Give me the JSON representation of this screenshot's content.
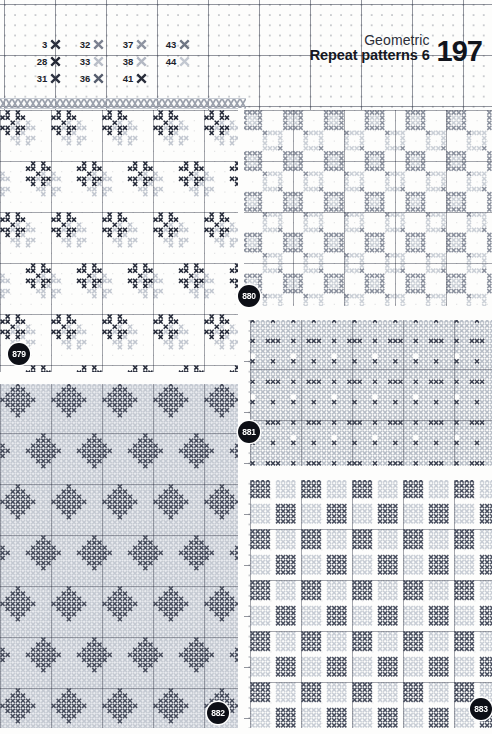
{
  "header": {
    "category": "Geometric",
    "title": "Repeat patterns 6",
    "page_number": "197"
  },
  "legend": {
    "symbol_name": "cross-stitch-symbol",
    "entries": [
      {
        "number": "3",
        "color": "#2b2f3d"
      },
      {
        "number": "32",
        "color": "#7b8190"
      },
      {
        "number": "37",
        "color": "#8e94a1"
      },
      {
        "number": "43",
        "color": "#6f7684"
      },
      {
        "number": "28",
        "color": "#232734"
      },
      {
        "number": "33",
        "color": "#b9bec8"
      },
      {
        "number": "38",
        "color": "#b3b8c3"
      },
      {
        "number": "44",
        "color": "#c3c8d1"
      },
      {
        "number": "31",
        "color": "#2e3342"
      },
      {
        "number": "36",
        "color": "#565d6d"
      },
      {
        "number": "41",
        "color": "#2a2e3b"
      },
      {
        "number": "",
        "color": ""
      }
    ]
  },
  "patterns": [
    {
      "id": "879",
      "badge_x": 8,
      "badge_y": 343,
      "x": 0,
      "y": 110,
      "w": 238,
      "h": 266,
      "cell": 5.1,
      "motif": "scattered-star-blocks",
      "colors": {
        "dark": "#262b3a",
        "shadow": "#bfc4cd",
        "bg": "#fdfdfc"
      },
      "style": "sparse"
    },
    {
      "id": "880",
      "badge_x": 238,
      "badge_y": 285,
      "x": 242,
      "y": 110,
      "w": 250,
      "h": 200,
      "cell": 5.1,
      "motif": "gray-block-checker",
      "colors": {
        "dark": "#8b919e",
        "shadow": "#c8cdd5",
        "bg": "#fdfdfc"
      },
      "style": "light"
    },
    {
      "id": "881",
      "badge_x": 238,
      "badge_y": 421,
      "x": 250,
      "y": 318,
      "w": 242,
      "h": 150,
      "cell": 5.1,
      "motif": "dense-diagonal-lattice",
      "colors": {
        "dark": "#3c4252",
        "shadow": "#b4bac4",
        "bg": "#fdfdfc"
      },
      "style": "dense"
    },
    {
      "id": "882",
      "badge_x": 207,
      "badge_y": 702,
      "x": 0,
      "y": 382,
      "w": 238,
      "h": 352,
      "cell": 5.1,
      "motif": "star-diamond-allover",
      "colors": {
        "dark": "#474d5d",
        "shadow": "#c2c7d0",
        "bg": "#e9ebef"
      },
      "style": "allover"
    },
    {
      "id": "883",
      "badge_x": 470,
      "badge_y": 698,
      "x": 250,
      "y": 478,
      "w": 242,
      "h": 256,
      "cell": 5.1,
      "motif": "square-block-checker",
      "colors": {
        "dark": "#4a5060",
        "shadow": "#c5cad3",
        "bg": "#fdfdfc"
      },
      "style": "blocks"
    }
  ]
}
